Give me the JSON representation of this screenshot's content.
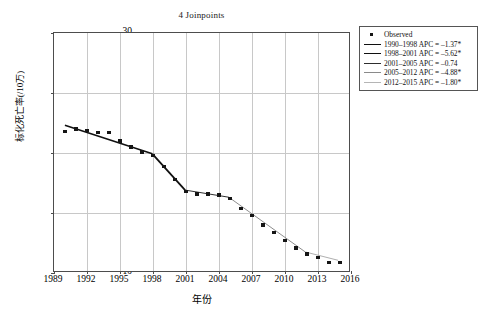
{
  "chart_data": {
    "type": "scatter",
    "title": "4 Joinpoints",
    "xlabel": "年份",
    "ylabel": "标化死亡率(/10万)",
    "xlim": [
      1989,
      2016
    ],
    "ylim": [
      10,
      30
    ],
    "xticks": [
      1989,
      1992,
      1995,
      1998,
      2001,
      2004,
      2007,
      2010,
      2013,
      2016
    ],
    "yticks": [
      10,
      15,
      20,
      25,
      30
    ],
    "grid": true,
    "legend_position": "right-top",
    "series": [
      {
        "name": "Observed",
        "type": "scatter",
        "marker": "square",
        "color": "#151515",
        "x": [
          1990,
          1991,
          1992,
          1993,
          1994,
          1995,
          1996,
          1997,
          1998,
          1999,
          2000,
          2001,
          2002,
          2003,
          2004,
          2005,
          2006,
          2007,
          2008,
          2009,
          2010,
          2011,
          2012,
          2013,
          2014,
          2015
        ],
        "y": [
          21.8,
          22.0,
          21.9,
          21.7,
          21.7,
          21.0,
          20.5,
          20.1,
          19.8,
          18.9,
          17.8,
          16.8,
          16.6,
          16.6,
          16.5,
          16.2,
          15.4,
          14.8,
          14.0,
          13.4,
          12.7,
          12.1,
          11.6,
          11.3,
          10.9,
          10.9
        ]
      },
      {
        "name": "1990-1998 APC = -1.37*",
        "type": "line",
        "segment": [
          1990,
          1998
        ],
        "apc": -1.37,
        "significant": true,
        "y_endpoints": [
          22.25,
          19.85
        ]
      },
      {
        "name": "1998-2001 APC = -5.62*",
        "type": "line",
        "segment": [
          1998,
          2001
        ],
        "apc": -5.62,
        "significant": true,
        "y_endpoints": [
          19.85,
          16.8
        ]
      },
      {
        "name": "2001-2005 APC = -0.74",
        "type": "line",
        "segment": [
          2001,
          2005
        ],
        "apc": -0.74,
        "significant": false,
        "y_endpoints": [
          16.8,
          16.2
        ]
      },
      {
        "name": "2005-2012 APC = -4.88*",
        "type": "line",
        "segment": [
          2005,
          2012
        ],
        "apc": -4.88,
        "significant": true,
        "y_endpoints": [
          16.2,
          11.6
        ]
      },
      {
        "name": "2012-2015 APC = -1.80*",
        "type": "line",
        "segment": [
          2012,
          2015
        ],
        "apc": -1.8,
        "significant": true,
        "y_endpoints": [
          11.6,
          10.9
        ]
      }
    ]
  },
  "legend": {
    "items": [
      {
        "label": "Observed",
        "key": "marker",
        "color": "#151515",
        "width": 0
      },
      {
        "label": "1990–1998 APC = –1.37*",
        "key": "line",
        "color": "#101010",
        "width": 1.6
      },
      {
        "label": "1998–2001 APC = –5.62*",
        "key": "line",
        "color": "#101010",
        "width": 1.9
      },
      {
        "label": "2001–2005 APC = –0.74",
        "key": "line",
        "color": "#2e2e2e",
        "width": 1.0
      },
      {
        "label": "2005–2012 APC = –4.88*",
        "key": "line",
        "color": "#8a8a8a",
        "width": 0.8
      },
      {
        "label": "2012–2015 APC = –1.80*",
        "key": "line",
        "color": "#b5b5b5",
        "width": 0.8
      }
    ]
  },
  "axis": {
    "xtick_labels": [
      "1989",
      "1992",
      "1995",
      "1998",
      "2001",
      "2004",
      "2007",
      "2010",
      "2013",
      "2016"
    ],
    "ytick_labels": [
      "30",
      "25",
      "20",
      "15",
      "10"
    ]
  }
}
